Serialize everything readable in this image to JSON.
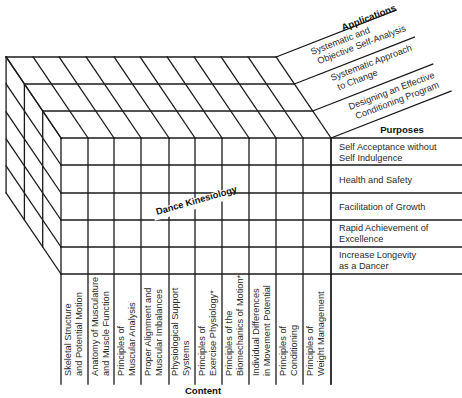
{
  "diagram": {
    "title": "Dance Kinesiology",
    "axes": {
      "applications_label": "Applications",
      "purposes_label": "Purposes",
      "content_label": "Content"
    },
    "applications": [
      {
        "line1": "Systematic and",
        "line2": "Objective Self-Analysis"
      },
      {
        "line1": "Systematic Approach",
        "line2": "to Change"
      },
      {
        "line1": "Designing an Effective",
        "line2": "Conditioning Program"
      }
    ],
    "purposes": [
      {
        "line1": "Self Acceptance without",
        "line2": "Self Indulgence"
      },
      {
        "line1": "Health and Safety",
        "line2": ""
      },
      {
        "line1": "Facilitation of Growth",
        "line2": ""
      },
      {
        "line1": "Rapid Achievement of",
        "line2": "Excellence"
      },
      {
        "line1": "Increase Longevity",
        "line2": "as a Dancer"
      }
    ],
    "content": [
      {
        "line1": "Skeletal Structure",
        "line2": "and Potential Motion"
      },
      {
        "line1": "Anatomy of Musculature",
        "line2": "and Muscle Function"
      },
      {
        "line1": "Principles of",
        "line2": "Muscular Analysis"
      },
      {
        "line1": "Proper Alignment and",
        "line2": "Muscular Imbalances"
      },
      {
        "line1": "Physiological Support",
        "line2": "Systems"
      },
      {
        "line1": "Principles of",
        "line2": "Exercise Physiology*"
      },
      {
        "line1": "Principles of the",
        "line2": "Biomechanics of Motion*"
      },
      {
        "line1": "Individual Differences",
        "line2": "in Movement Potential"
      },
      {
        "line1": "Principles of",
        "line2": "Conditioning"
      },
      {
        "line1": "Principles of",
        "line2": "Weight Management"
      }
    ],
    "geometry": {
      "front_cols_x": [
        61,
        88,
        114,
        141,
        169,
        195,
        222,
        249,
        276,
        303,
        331
      ],
      "front_rows_y": [
        138,
        165,
        193,
        220,
        247,
        274
      ],
      "layer_offset": {
        "dx": -18.3,
        "dy": -27
      },
      "layers": 4,
      "purposes_right_x": 462,
      "content_bottom_y": 384,
      "app_slope": -0.39,
      "app_line_len_x": 120
    },
    "colors": {
      "line": "#1a1a1a",
      "text": "#2a2a2a",
      "background": "#ffffff"
    }
  }
}
